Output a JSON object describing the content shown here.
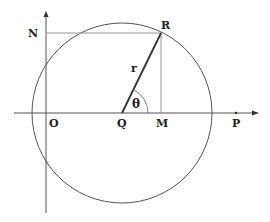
{
  "diagram": {
    "colors": {
      "stroke": "#555555",
      "thin": "#888888",
      "text": "#222222"
    },
    "labels": {
      "N": "N",
      "R": "R",
      "r": "r",
      "theta": "θ",
      "O": "O",
      "Q": "Q",
      "M": "M",
      "P": "P"
    },
    "points": {
      "O": [
        46,
        113
      ],
      "Q": [
        122,
        113
      ],
      "R": [
        161,
        33
      ],
      "M": [
        161,
        113
      ],
      "N": [
        46,
        33
      ],
      "P": [
        236,
        113
      ]
    },
    "circle": {
      "center": "Q",
      "radius": 90
    }
  }
}
